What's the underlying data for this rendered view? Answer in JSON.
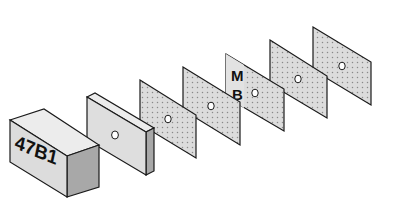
{
  "diagram": {
    "block": {
      "label": "47B1"
    },
    "thick_plate": {
      "has_center_hole": true
    },
    "plates": [
      {
        "index": 1,
        "label": ""
      },
      {
        "index": 2,
        "label": ""
      },
      {
        "index": 3,
        "label_top": "M",
        "label_bottom": "B"
      },
      {
        "index": 4,
        "label": ""
      },
      {
        "index": 5,
        "label": ""
      }
    ],
    "colors": {
      "outline": "#1a1a1a",
      "face_light": "#e4e4e4",
      "face_mid": "#d6d6d6",
      "face_dark": "#a8a8a8",
      "dots": "#8a8a8a"
    }
  }
}
